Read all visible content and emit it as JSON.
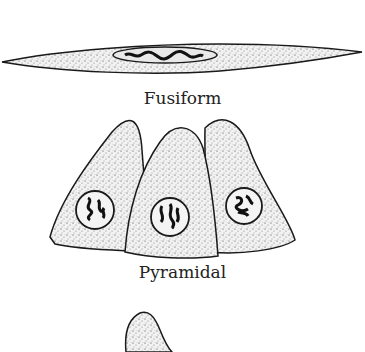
{
  "diagram": {
    "cells": [
      {
        "name": "fusiform",
        "label": "Fusiform"
      },
      {
        "name": "pyramidal",
        "label": "Pyramidal"
      },
      {
        "name": "partial-cell",
        "label": ""
      }
    ],
    "colors": {
      "outline": "#1a1a1a",
      "stipple": "#555555",
      "background": "#ffffff"
    }
  }
}
